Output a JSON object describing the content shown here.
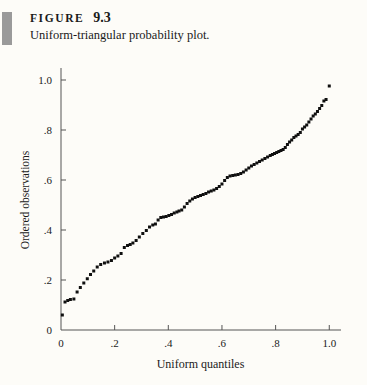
{
  "figure": {
    "label": "FIGURE",
    "number": "9.3",
    "caption": "Uniform-triangular probability plot."
  },
  "colors": {
    "background": "#fdfcf8",
    "ink": "#1a1a1a",
    "axis": "#555555",
    "marker": "#101010",
    "side_bar": "#9a9a9a"
  },
  "chart_data": {
    "type": "scatter",
    "title": "Uniform-triangular probability plot.",
    "xlabel": "Uniform quantiles",
    "ylabel": "Ordered observations",
    "xlim": [
      0,
      1.04
    ],
    "ylim": [
      0,
      1.04
    ],
    "xticks": [
      0,
      0.2,
      0.4,
      0.6,
      0.8,
      1.0
    ],
    "xticklabels": [
      "0",
      ".2",
      ".4",
      ".6",
      ".8",
      "1.0"
    ],
    "yticks": [
      0,
      0.2,
      0.4,
      0.6,
      0.8,
      1.0
    ],
    "yticklabels": [
      "0",
      ".2",
      ".4",
      ".6",
      ".8",
      "1.0"
    ],
    "grid": false,
    "legend": null,
    "marker": "filled-square",
    "marker_size": 3,
    "n_points": 100,
    "points": [
      [
        0.005,
        0.06
      ],
      [
        0.015,
        0.112
      ],
      [
        0.025,
        0.118
      ],
      [
        0.035,
        0.122
      ],
      [
        0.048,
        0.124
      ],
      [
        0.06,
        0.152
      ],
      [
        0.072,
        0.17
      ],
      [
        0.085,
        0.188
      ],
      [
        0.098,
        0.205
      ],
      [
        0.11,
        0.222
      ],
      [
        0.122,
        0.236
      ],
      [
        0.135,
        0.252
      ],
      [
        0.148,
        0.262
      ],
      [
        0.162,
        0.268
      ],
      [
        0.175,
        0.272
      ],
      [
        0.188,
        0.278
      ],
      [
        0.2,
        0.288
      ],
      [
        0.212,
        0.296
      ],
      [
        0.224,
        0.306
      ],
      [
        0.236,
        0.33
      ],
      [
        0.248,
        0.338
      ],
      [
        0.258,
        0.342
      ],
      [
        0.268,
        0.348
      ],
      [
        0.28,
        0.358
      ],
      [
        0.292,
        0.372
      ],
      [
        0.305,
        0.386
      ],
      [
        0.318,
        0.398
      ],
      [
        0.33,
        0.412
      ],
      [
        0.342,
        0.42
      ],
      [
        0.352,
        0.424
      ],
      [
        0.362,
        0.44
      ],
      [
        0.372,
        0.45
      ],
      [
        0.382,
        0.452
      ],
      [
        0.392,
        0.454
      ],
      [
        0.402,
        0.458
      ],
      [
        0.412,
        0.462
      ],
      [
        0.422,
        0.468
      ],
      [
        0.432,
        0.472
      ],
      [
        0.44,
        0.476
      ],
      [
        0.45,
        0.48
      ],
      [
        0.46,
        0.492
      ],
      [
        0.47,
        0.506
      ],
      [
        0.48,
        0.516
      ],
      [
        0.49,
        0.524
      ],
      [
        0.5,
        0.53
      ],
      [
        0.51,
        0.534
      ],
      [
        0.52,
        0.538
      ],
      [
        0.53,
        0.542
      ],
      [
        0.54,
        0.546
      ],
      [
        0.55,
        0.552
      ],
      [
        0.56,
        0.556
      ],
      [
        0.57,
        0.56
      ],
      [
        0.58,
        0.566
      ],
      [
        0.59,
        0.574
      ],
      [
        0.6,
        0.584
      ],
      [
        0.61,
        0.598
      ],
      [
        0.62,
        0.61
      ],
      [
        0.63,
        0.616
      ],
      [
        0.64,
        0.618
      ],
      [
        0.65,
        0.62
      ],
      [
        0.66,
        0.622
      ],
      [
        0.67,
        0.626
      ],
      [
        0.68,
        0.632
      ],
      [
        0.69,
        0.64
      ],
      [
        0.7,
        0.648
      ],
      [
        0.71,
        0.656
      ],
      [
        0.72,
        0.662
      ],
      [
        0.73,
        0.668
      ],
      [
        0.74,
        0.674
      ],
      [
        0.75,
        0.68
      ],
      [
        0.76,
        0.686
      ],
      [
        0.77,
        0.692
      ],
      [
        0.78,
        0.698
      ],
      [
        0.788,
        0.702
      ],
      [
        0.796,
        0.706
      ],
      [
        0.804,
        0.71
      ],
      [
        0.812,
        0.714
      ],
      [
        0.82,
        0.718
      ],
      [
        0.828,
        0.722
      ],
      [
        0.836,
        0.73
      ],
      [
        0.844,
        0.742
      ],
      [
        0.852,
        0.752
      ],
      [
        0.86,
        0.76
      ],
      [
        0.868,
        0.77
      ],
      [
        0.876,
        0.776
      ],
      [
        0.884,
        0.782
      ],
      [
        0.892,
        0.79
      ],
      [
        0.9,
        0.804
      ],
      [
        0.908,
        0.812
      ],
      [
        0.916,
        0.82
      ],
      [
        0.924,
        0.832
      ],
      [
        0.932,
        0.844
      ],
      [
        0.94,
        0.856
      ],
      [
        0.948,
        0.864
      ],
      [
        0.956,
        0.874
      ],
      [
        0.964,
        0.886
      ],
      [
        0.972,
        0.898
      ],
      [
        0.98,
        0.916
      ],
      [
        0.988,
        0.922
      ],
      [
        1.0,
        0.976
      ]
    ]
  }
}
